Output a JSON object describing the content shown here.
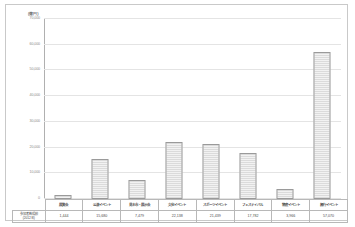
{
  "chart_data": {
    "type": "bar",
    "title": "",
    "subtitle": "",
    "xlabel": "",
    "ylabel": "(億円)",
    "unit_label": "(億円)",
    "ylim": [
      0,
      70000
    ],
    "grid": true,
    "legend": "none",
    "yticks": [
      0,
      10000,
      20000,
      30000,
      40000,
      50000,
      60000,
      70000
    ],
    "ytick_labels": [
      "0",
      "10,000",
      "20,000",
      "30,000",
      "40,000",
      "50,000",
      "60,000",
      "70,000"
    ],
    "categories": [
      "展覧会",
      "公演イベント",
      "見本市・展示会",
      "文化イベント",
      "スポーツイベント",
      "フェスティバル",
      "物産イベント",
      "興行イベント"
    ],
    "values": [
      1444,
      15680,
      7479,
      22138,
      21439,
      17782,
      3966,
      57070
    ],
    "value_labels": [
      "1,444",
      "15,680",
      "7,479",
      "22,138",
      "21,439",
      "17,782",
      "3,966",
      "57,070"
    ],
    "bar_style": {
      "fill": "#f2f2f2",
      "pattern": "dotted",
      "border": "#9a9a9a"
    }
  },
  "table": {
    "row_header_line1": "参加者数規模",
    "row_header_line2": "(2012年)"
  }
}
